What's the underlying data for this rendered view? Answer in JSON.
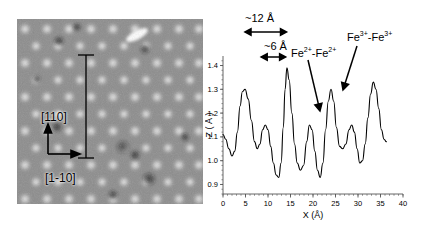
{
  "figure": {
    "panels": [
      {
        "name": "stm-topograph"
      },
      {
        "name": "line-profile-plot"
      }
    ]
  },
  "stm": {
    "direction_labels": [
      {
        "name": "in-plane-110",
        "text": "[110]"
      },
      {
        "name": "in-plane-1-10",
        "text": "[1-10]"
      }
    ],
    "linescan_marker": "vertical-line-scan-bracket"
  },
  "chart_data": {
    "type": "line",
    "title": "",
    "xlabel": "X (Å)",
    "ylabel": "Z ( Å )",
    "xlim": [
      0,
      40
    ],
    "ylim": [
      0.86,
      1.44
    ],
    "xticks": [
      0,
      5,
      10,
      15,
      20,
      25,
      30,
      35,
      40
    ],
    "xtick_labels": [
      "0",
      "5",
      "10",
      "15",
      "20",
      "25",
      "30",
      "35",
      "40"
    ],
    "yticks": [
      0.9,
      1.0,
      1.1,
      1.2,
      1.3,
      1.4
    ],
    "ytick_labels": [
      "0.9",
      "1.0",
      "1.1",
      "1.2",
      "1.3",
      "1.4"
    ],
    "grid": false,
    "legend": "none",
    "series": [
      {
        "name": "height-profile",
        "color": "#000000",
        "x": [
          0.0,
          0.6,
          1.3,
          2.0,
          2.6,
          3.2,
          3.8,
          4.3,
          4.9,
          5.6,
          6.3,
          7.0,
          7.6,
          8.2,
          8.8,
          9.4,
          10.0,
          10.6,
          11.2,
          11.8,
          12.4,
          12.9,
          13.4,
          13.8,
          14.2,
          14.7,
          15.3,
          15.9,
          16.5,
          17.2,
          17.9,
          18.6,
          19.2,
          19.8,
          20.4,
          21.0,
          21.6,
          22.2,
          22.8,
          23.4,
          24.0,
          24.6,
          25.2,
          25.9,
          26.6,
          27.3,
          28.0,
          28.6,
          29.2,
          29.8,
          30.4,
          31.0,
          31.6,
          32.2,
          32.8,
          33.4,
          34.0,
          34.6,
          35.2,
          35.8,
          36.3
        ],
        "y": [
          1.11,
          1.09,
          1.05,
          1.02,
          1.04,
          1.12,
          1.23,
          1.29,
          1.3,
          1.26,
          1.17,
          1.08,
          1.05,
          1.07,
          1.13,
          1.15,
          1.13,
          1.06,
          0.99,
          0.94,
          0.93,
          0.99,
          1.14,
          1.3,
          1.39,
          1.34,
          1.2,
          1.07,
          0.99,
          0.96,
          0.98,
          1.08,
          1.15,
          1.13,
          1.04,
          0.96,
          0.93,
          0.99,
          1.13,
          1.25,
          1.3,
          1.25,
          1.14,
          1.06,
          1.05,
          1.07,
          1.13,
          1.15,
          1.12,
          1.05,
          0.99,
          1.0,
          1.07,
          1.18,
          1.28,
          1.33,
          1.3,
          1.22,
          1.13,
          1.09,
          1.08
        ]
      }
    ],
    "annotations": [
      {
        "name": "spacing-12-angstrom",
        "text": "~12 Å",
        "x_start": 5.0,
        "x_end": 14.0,
        "kind": "double-headed-arrow"
      },
      {
        "name": "spacing-6-angstrom",
        "text": "~6 Å",
        "x_start": 8.6,
        "x_end": 13.8,
        "kind": "double-headed-arrow"
      },
      {
        "name": "fe2-fe2-pair",
        "text_base": "Fe",
        "text_sup": "2+",
        "separator": "-",
        "full_text": "Fe2+-Fe2+",
        "points_to_x": 20.6,
        "kind": "arrow-label"
      },
      {
        "name": "fe3-fe3-pair",
        "text_base": "Fe",
        "text_sup": "3+",
        "separator": "-",
        "full_text": "Fe3+-Fe3+",
        "points_to_x": 23.5,
        "kind": "arrow-label"
      }
    ]
  }
}
